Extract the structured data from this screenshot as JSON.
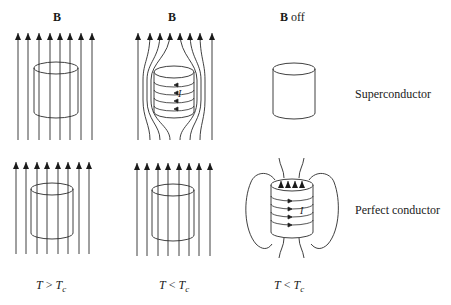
{
  "header_labels": {
    "col1": "B",
    "col2": "B",
    "col3_bold": "B",
    "col3_rest": " off"
  },
  "row_labels": {
    "top": "Superconductor",
    "bottom": "Perfect conductor"
  },
  "temperature_labels": [
    {
      "var": "T",
      "op": " > ",
      "rhs": "T",
      "sub": "c"
    },
    {
      "var": "T",
      "op": " < ",
      "rhs": "T",
      "sub": "c"
    },
    {
      "var": "T",
      "op": " < ",
      "rhs": "T",
      "sub": "c"
    }
  ],
  "current_label": "I",
  "colors": {
    "stroke": "#2a2a2a",
    "background": "#ffffff"
  }
}
